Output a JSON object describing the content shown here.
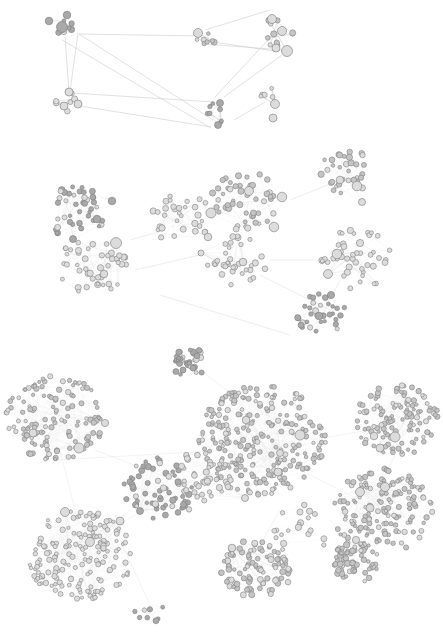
{
  "figure": {
    "width": 443,
    "height": 633,
    "background": "#ffffff",
    "colors": {
      "node_fill_light": "#dcdcdc",
      "node_fill_mid": "#c4c4c4",
      "node_fill_dark": "#a9a9a9",
      "node_stroke": "#7a7a7a",
      "edge": "#cfcfcf",
      "edge_faint": "#e6e6e6"
    }
  },
  "panels": [
    {
      "id": "top",
      "top": 0,
      "height": 140,
      "edge_opacity": 0.9,
      "clusters": [
        {
          "cx": 62,
          "cy": 28,
          "n": 6,
          "r": 10,
          "seed": 11,
          "big": [
            [
              62,
              27,
              5.5
            ],
            [
              67,
              15,
              3.8
            ],
            [
              49,
              21,
              3.8
            ]
          ],
          "fill": "dark"
        },
        {
          "cx": 68,
          "cy": 103,
          "n": 7,
          "r": 11,
          "seed": 12,
          "big": [
            [
              69,
              92,
              4
            ],
            [
              78,
              104,
              4
            ],
            [
              64,
              106,
              4
            ]
          ],
          "fill": "light"
        },
        {
          "cx": 205,
          "cy": 38,
          "n": 9,
          "r": 10,
          "seed": 13,
          "big": [
            [
              198,
              33,
              4.5
            ]
          ],
          "fill": "mid"
        },
        {
          "cx": 278,
          "cy": 32,
          "n": 10,
          "r": 16,
          "seed": 14,
          "big": [
            [
              272,
              19,
              4.5
            ],
            [
              282,
              31,
              4.5
            ],
            [
              287,
              51,
              5.5
            ],
            [
              276,
              48,
              4
            ]
          ],
          "fill": "mid"
        },
        {
          "cx": 220,
          "cy": 112,
          "n": 7,
          "r": 12,
          "seed": 15,
          "big": [
            [
              220,
              103,
              3.5
            ],
            [
              218,
              125,
              3.5
            ]
          ],
          "fill": "dark"
        },
        {
          "cx": 268,
          "cy": 96,
          "n": 6,
          "r": 10,
          "seed": 16,
          "big": [
            [
              275,
              104,
              4.5
            ],
            [
              273,
              118,
              4
            ]
          ],
          "fill": "light"
        }
      ],
      "links": [
        [
          [
            79,
            34
          ],
          [
            200,
            36
          ]
        ],
        [
          [
            79,
            34
          ],
          [
            213,
            120
          ]
        ],
        [
          [
            62,
            40
          ],
          [
            211,
            128
          ]
        ],
        [
          [
            65,
            37
          ],
          [
            69,
            91
          ]
        ],
        [
          [
            78,
            33
          ],
          [
            70,
            91
          ]
        ],
        [
          [
            72,
            93
          ],
          [
            214,
            102
          ]
        ],
        [
          [
            80,
            106
          ],
          [
            211,
            127
          ]
        ],
        [
          [
            200,
            40
          ],
          [
            274,
            51
          ]
        ],
        [
          [
            205,
            30
          ],
          [
            270,
            10
          ]
        ],
        [
          [
            205,
            44
          ],
          [
            283,
            50
          ]
        ],
        [
          [
            215,
            97
          ],
          [
            268,
            40
          ]
        ],
        [
          [
            224,
            97
          ],
          [
            282,
            55
          ]
        ],
        [
          [
            234,
            120
          ],
          [
            265,
            102
          ]
        ]
      ],
      "dashed_links": [
        [
          0,
          1
        ],
        [
          2,
          3
        ]
      ]
    },
    {
      "id": "middle",
      "top": 140,
      "height": 200,
      "edge_opacity": 0.55,
      "clusters": [
        {
          "cx": 75,
          "cy": 72,
          "n": 42,
          "r": 28,
          "seed": 21,
          "big": [
            [
              112,
              61,
              3.8
            ],
            [
              97,
              79,
              3.8
            ],
            [
              73,
              99,
              3.5
            ]
          ],
          "fill": "dark"
        },
        {
          "cx": 92,
          "cy": 127,
          "n": 46,
          "r": 32,
          "seed": 22,
          "big": [
            [
              116,
              103,
              5.5
            ],
            [
              104,
              134,
              3.8
            ]
          ],
          "fill": "light"
        },
        {
          "cx": 182,
          "cy": 80,
          "n": 30,
          "r": 28,
          "seed": 23,
          "big": [
            [
              208,
              97,
              3.8
            ],
            [
              162,
              88,
              3.2
            ]
          ],
          "fill": "light"
        },
        {
          "cx": 246,
          "cy": 61,
          "n": 48,
          "r": 32,
          "seed": 24,
          "big": [
            [
              249,
              51,
              4.5
            ],
            [
              211,
              73,
              5
            ],
            [
              282,
              57,
              4.8
            ],
            [
              274,
              87,
              4.8
            ]
          ],
          "fill": "mid"
        },
        {
          "cx": 238,
          "cy": 121,
          "n": 34,
          "r": 28,
          "seed": 25,
          "big": [
            [
              243,
              122,
              3.8
            ],
            [
              201,
              113,
              3
            ]
          ],
          "fill": "light"
        },
        {
          "cx": 345,
          "cy": 33,
          "n": 34,
          "r": 26,
          "seed": 26,
          "big": [
            [
              357,
              46,
              4.8
            ],
            [
              340,
              40,
              3.8
            ],
            [
              362,
              62,
              3.5
            ]
          ],
          "fill": "mid"
        },
        {
          "cx": 356,
          "cy": 119,
          "n": 44,
          "r": 32,
          "seed": 27,
          "big": [
            [
              337,
              114,
              4.8
            ],
            [
              328,
              134,
              4.5
            ],
            [
              360,
              103,
              3.6
            ]
          ],
          "fill": "light"
        },
        {
          "cx": 320,
          "cy": 175,
          "n": 32,
          "r": 24,
          "seed": 28,
          "big": [
            [
              319,
              176,
              3.8
            ],
            [
              331,
              155,
              3.6
            ]
          ],
          "fill": "dark"
        }
      ],
      "links": [
        [
          [
            130,
            100
          ],
          [
            165,
            90
          ]
        ],
        [
          [
            135,
            130
          ],
          [
            200,
            115
          ]
        ],
        [
          [
            270,
            120
          ],
          [
            320,
            120
          ]
        ],
        [
          [
            290,
            60
          ],
          [
            340,
            40
          ]
        ],
        [
          [
            260,
            135
          ],
          [
            330,
            170
          ]
        ],
        [
          [
            160,
            155
          ],
          [
            290,
            195
          ]
        ],
        [
          [
            340,
            140
          ],
          [
            330,
            160
          ]
        ]
      ],
      "dashed_links": []
    },
    {
      "id": "bottom",
      "top": 340,
      "height": 293,
      "edge_opacity": 0.35,
      "clusters": [
        {
          "cx": 190,
          "cy": 23,
          "n": 32,
          "r": 16,
          "seed": 31,
          "big": [
            [
              193,
              28,
              3
            ],
            [
              183,
              30,
              3
            ]
          ],
          "fill": "dark"
        },
        {
          "cx": 55,
          "cy": 78,
          "n": 130,
          "r": 45,
          "seed": 32,
          "big": [
            [
              79,
              108,
              5
            ],
            [
              33,
              93,
              4
            ],
            [
              105,
              83,
              3.6
            ]
          ],
          "fill": "mid"
        },
        {
          "cx": 262,
          "cy": 100,
          "n": 260,
          "r": 58,
          "seed": 33,
          "big": [
            [
              300,
              95,
              5
            ],
            [
              246,
              80,
              3.8
            ],
            [
              278,
              132,
              4
            ],
            [
              280,
              113,
              3.5
            ]
          ],
          "fill": "mid"
        },
        {
          "cx": 397,
          "cy": 80,
          "n": 120,
          "r": 38,
          "seed": 34,
          "big": [
            [
              395,
              97,
              5
            ],
            [
              380,
              108,
              4
            ],
            [
              374,
              96,
              3.8
            ]
          ],
          "fill": "mid"
        },
        {
          "cx": 80,
          "cy": 215,
          "n": 170,
          "r": 48,
          "seed": 35,
          "big": [
            [
              65,
              172,
              4.5
            ],
            [
              90,
              202,
              4.5
            ],
            [
              120,
              181,
              4
            ]
          ],
          "fill": "light"
        },
        {
          "cx": 382,
          "cy": 172,
          "n": 150,
          "r": 46,
          "seed": 36,
          "big": [
            [
              385,
              147,
              4.5
            ],
            [
              360,
              152,
              4.5
            ],
            [
              370,
              168,
              4
            ]
          ],
          "fill": "mid"
        },
        {
          "cx": 256,
          "cy": 230,
          "n": 90,
          "r": 32,
          "seed": 37,
          "big": [
            [
              232,
              208,
              3.8
            ]
          ],
          "fill": "mid"
        },
        {
          "cx": 356,
          "cy": 222,
          "n": 60,
          "r": 22,
          "seed": 38,
          "big": [
            [
              356,
              200,
              3.6
            ]
          ],
          "fill": "mid"
        },
        {
          "cx": 160,
          "cy": 150,
          "n": 70,
          "r": 34,
          "seed": 39,
          "big": [
            [
              140,
              171,
              3.5
            ]
          ],
          "fill": "dark"
        },
        {
          "cx": 205,
          "cy": 135,
          "n": 40,
          "r": 28,
          "seed": 40,
          "big": [
            [
              245,
              158,
              3.5
            ]
          ],
          "fill": "light"
        },
        {
          "cx": 150,
          "cy": 265,
          "n": 8,
          "r": 18,
          "seed": 41,
          "big": [],
          "fill": "dark"
        },
        {
          "cx": 300,
          "cy": 190,
          "n": 20,
          "r": 30,
          "seed": 42,
          "big": [],
          "fill": "light"
        }
      ],
      "links": [
        [
          [
            60,
            110
          ],
          [
            75,
            170
          ]
        ],
        [
          [
            95,
            110
          ],
          [
            200,
            150
          ]
        ],
        [
          [
            110,
            190
          ],
          [
            210,
            130
          ]
        ],
        [
          [
            200,
            30
          ],
          [
            240,
            60
          ]
        ],
        [
          [
            310,
            100
          ],
          [
            370,
            90
          ]
        ],
        [
          [
            300,
            130
          ],
          [
            360,
            160
          ]
        ],
        [
          [
            395,
            115
          ],
          [
            385,
            135
          ]
        ],
        [
          [
            280,
            170
          ],
          [
            260,
            205
          ]
        ],
        [
          [
            330,
            180
          ],
          [
            350,
            205
          ]
        ],
        [
          [
            120,
            200
          ],
          [
            150,
            265
          ]
        ],
        [
          [
            55,
            120
          ],
          [
            230,
            110
          ]
        ]
      ],
      "dashed_links": []
    }
  ]
}
